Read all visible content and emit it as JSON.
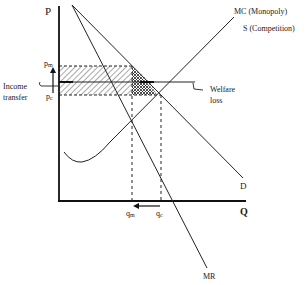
{
  "diagram": {
    "axes": {
      "y_label": "P",
      "x_label": "Q"
    },
    "curves": {
      "demand": "D",
      "marginal_revenue": "MR",
      "marginal_cost": "MC (Monopoly)",
      "supply": "S (Competition)"
    },
    "prices": {
      "monopoly": "p",
      "monopoly_sub": "m",
      "competitive": "p",
      "competitive_sub": "c"
    },
    "quantities": {
      "monopoly": "q",
      "monopoly_sub": "m",
      "competitive": "q",
      "competitive_sub": "c"
    },
    "annotations": {
      "income_transfer_line1": "Income",
      "income_transfer_line2": "transfer",
      "welfare_loss_line1": "Welfare",
      "welfare_loss_line2": "loss"
    },
    "colors": {
      "ink": "#1a1a1a",
      "background": "#ffffff"
    }
  }
}
